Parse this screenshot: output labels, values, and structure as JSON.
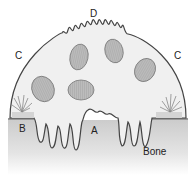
{
  "diagram": {
    "labels": {
      "A": "A",
      "B": "B",
      "C_left": "C",
      "C_right": "C",
      "D": "D",
      "bone": "Bone"
    },
    "nuclei_count": 5,
    "colors": {
      "cell_fill": "#f0f0f0",
      "cell_outline": "#444444",
      "nucleus_fill": "#b9b9b9",
      "nucleus_outline": "#777777",
      "bone_top": "#cfcfcf",
      "bone_bottom": "#ffffff",
      "sealing_zone_fill": "#d8d8d8"
    }
  }
}
